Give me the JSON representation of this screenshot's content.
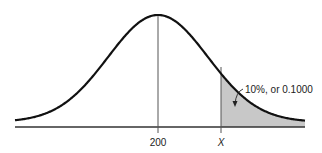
{
  "chart_data": {
    "type": "area",
    "title": "",
    "mean": 200,
    "xlabel": "",
    "ylabel": "",
    "tick_labels": [
      "200",
      "X"
    ],
    "shaded_region": {
      "from": "X",
      "to": "+inf",
      "area": 0.1
    },
    "annotation": "10%, or 0.1000",
    "grid": false,
    "legend": null
  },
  "labels": {
    "mean_tick": "200",
    "x_tick": "X",
    "tail_annotation": "10%, or 0.1000"
  },
  "colors": {
    "curve": "#111111",
    "shade": "#c8c8c8",
    "axis": "#333333",
    "reference_line": "#555555"
  }
}
